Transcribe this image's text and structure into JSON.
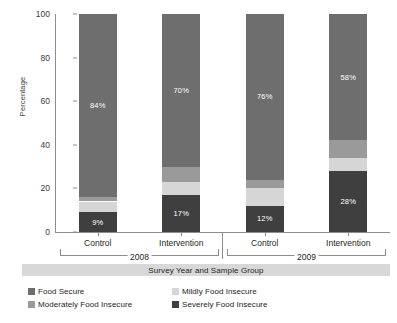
{
  "chart_data": {
    "type": "bar",
    "stacked": true,
    "title": "",
    "xlabel": "Survey Year and Sample Group",
    "ylabel": "Percentage",
    "ylim": [
      0,
      100
    ],
    "yticks": [
      0,
      20,
      40,
      60,
      80,
      100
    ],
    "grid": false,
    "legend_position": "bottom",
    "categories": [
      "Control",
      "Intervention",
      "Control",
      "Intervention"
    ],
    "groups": [
      {
        "year": "2008",
        "categories": [
          "Control",
          "Intervention"
        ]
      },
      {
        "year": "2009",
        "categories": [
          "Control",
          "Intervention"
        ]
      }
    ],
    "series": [
      {
        "name": "Severely Food Insecure",
        "color": "#3f3f3f",
        "values": [
          9,
          17,
          12,
          28
        ],
        "labels": [
          "9%",
          "17%",
          "12%",
          "28%"
        ]
      },
      {
        "name": "Mildly Food Insecure",
        "color": "#d6d6d6",
        "values": [
          5,
          6,
          8,
          6
        ],
        "labels": [
          "",
          "",
          "",
          ""
        ]
      },
      {
        "name": "Moderately Food Insecure",
        "color": "#9a9a9a",
        "values": [
          2,
          7,
          4,
          8
        ],
        "labels": [
          "",
          "",
          "",
          ""
        ]
      },
      {
        "name": "Food Secure",
        "color": "#6e6e6e",
        "values": [
          84,
          70,
          76,
          58
        ],
        "labels": [
          "84%",
          "70%",
          "76%",
          "58%"
        ]
      }
    ]
  },
  "axis": {
    "y_label": "Percentage",
    "y_ticks": [
      "0",
      "20",
      "40",
      "60",
      "80",
      "100"
    ],
    "x_title": "Survey Year and Sample Group",
    "group_labels": [
      "Control",
      "Intervention",
      "Control",
      "Intervention"
    ],
    "year_labels": [
      "2008",
      "2009"
    ]
  },
  "legend": {
    "items": [
      {
        "label": "Food Secure",
        "color": "#6e6e6e"
      },
      {
        "label": "Mildly Food Insecure",
        "color": "#d6d6d6"
      },
      {
        "label": "Moderately Food Insecure",
        "color": "#9a9a9a"
      },
      {
        "label": "Severely Food Insecure",
        "color": "#3f3f3f"
      }
    ]
  },
  "bar_value_labels": {
    "bar_0_bottom": "9%",
    "bar_0_top": "84%",
    "bar_1_bottom": "17%",
    "bar_1_top": "70%",
    "bar_2_bottom": "12%",
    "bar_2_top": "76%",
    "bar_3_bottom": "28%",
    "bar_3_top": "58%"
  }
}
